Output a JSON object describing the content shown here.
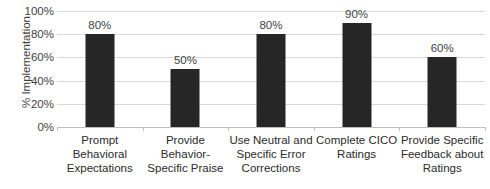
{
  "chart_data": {
    "type": "bar",
    "title": "",
    "subtitle": "",
    "xlabel": "",
    "ylabel": "% Implementation",
    "ylim": [
      0,
      100
    ],
    "grid": true,
    "legend": "none",
    "categories": [
      "Prompt Behavioral Expectations",
      "Provide Behavior-Specific Praise",
      "Use Neutral and Specific Error Corrections",
      "Complete CICO Ratings",
      "Provide Specific Feedback about Ratings"
    ],
    "values": [
      80,
      50,
      80,
      90,
      60
    ],
    "value_labels": [
      "80%",
      "50%",
      "80%",
      "90%",
      "60%"
    ],
    "ytick_labels": [
      "100%",
      "80%",
      "60%",
      "40%",
      "20%",
      "0%"
    ],
    "ytick_values": [
      100,
      80,
      60,
      40,
      20,
      0
    ],
    "colors": {
      "bar": "#262626",
      "gridline": "#d9d9d9",
      "axis": "#bfbfbf",
      "text": "#3f3f3f",
      "background": "#ffffff"
    }
  },
  "axis": {
    "y_title": "% Implementation"
  }
}
